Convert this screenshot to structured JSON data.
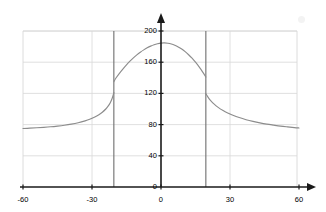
{
  "chart_data": {
    "type": "line",
    "title": "",
    "xlabel": "",
    "ylabel": "",
    "xlim": [
      -60,
      60
    ],
    "ylim": [
      0,
      200
    ],
    "xticks": [
      -60,
      -30,
      0,
      30,
      60
    ],
    "yticks": [
      0,
      40,
      80,
      120,
      160,
      200
    ],
    "xtick_labels": [
      "-60",
      "-30",
      "0",
      "30",
      "60"
    ],
    "ytick_labels": [
      "0",
      "40",
      "80",
      "120",
      "160",
      "200"
    ],
    "grid": true,
    "grid_color": "#d8d8d8",
    "axis_color": "#1a1a1a",
    "curve_color": "#8c8c8c",
    "asymptote_color": "#6e6e6e",
    "background": "#ffffff",
    "legend": null,
    "annotations": [],
    "vertical_lines": [
      -20.5,
      19.5
    ],
    "series": [
      {
        "name": "curve",
        "segments": [
          {
            "name": "left-tail",
            "points": [
              [
                -60,
                75.0
              ],
              [
                -57,
                75.4
              ],
              [
                -54,
                75.9
              ],
              [
                -51,
                76.5
              ],
              [
                -48,
                77.2
              ],
              [
                -45,
                78.1
              ],
              [
                -42,
                79.2
              ],
              [
                -39,
                80.6
              ],
              [
                -36,
                82.4
              ],
              [
                -33,
                84.8
              ],
              [
                -31,
                86.8
              ],
              [
                -29,
                89.4
              ],
              [
                -27,
                92.7
              ],
              [
                -25.5,
                95.9
              ],
              [
                -24,
                100.0
              ],
              [
                -23,
                103.6
              ],
              [
                -22,
                108.4
              ],
              [
                -21.3,
                113.2
              ],
              [
                -20.8,
                117.6
              ],
              [
                -20.5,
                121.0
              ]
            ]
          },
          {
            "name": "central-hump",
            "points": [
              [
                -20.5,
                135.0
              ],
              [
                -19.5,
                140.0
              ],
              [
                -18,
                146.0
              ],
              [
                -16.5,
                151.5
              ],
              [
                -15,
                156.6
              ],
              [
                -13.5,
                161.3
              ],
              [
                -12,
                165.6
              ],
              [
                -10.5,
                169.4
              ],
              [
                -9,
                172.8
              ],
              [
                -7.5,
                175.8
              ],
              [
                -6,
                178.4
              ],
              [
                -4.5,
                180.6
              ],
              [
                -3,
                182.4
              ],
              [
                -1.5,
                183.7
              ],
              [
                0,
                184.5
              ],
              [
                1.5,
                184.7
              ],
              [
                3,
                184.3
              ],
              [
                4.5,
                183.3
              ],
              [
                6,
                181.7
              ],
              [
                7.5,
                179.5
              ],
              [
                9,
                176.8
              ],
              [
                10.5,
                173.5
              ],
              [
                12,
                169.6
              ],
              [
                13.5,
                165.1
              ],
              [
                15,
                160.0
              ],
              [
                16.5,
                154.3
              ],
              [
                18,
                148.0
              ],
              [
                19.5,
                141.0
              ]
            ]
          },
          {
            "name": "right-tail",
            "points": [
              [
                19.5,
                119.5
              ],
              [
                20.5,
                115.0
              ],
              [
                21.5,
                111.2
              ],
              [
                23,
                106.6
              ],
              [
                25,
                101.8
              ],
              [
                27,
                98.0
              ],
              [
                29,
                94.9
              ],
              [
                31,
                92.3
              ],
              [
                34,
                89.0
              ],
              [
                37,
                86.3
              ],
              [
                40,
                84.1
              ],
              [
                43,
                82.2
              ],
              [
                46,
                80.6
              ],
              [
                49,
                79.3
              ],
              [
                52,
                78.1
              ],
              [
                55,
                77.1
              ],
              [
                58,
                76.2
              ],
              [
                60,
                75.7
              ]
            ]
          }
        ]
      }
    ]
  },
  "axes": {
    "x_axis_name": "x-axis",
    "y_axis_name": "y-axis",
    "x_arrow": "right-arrow",
    "y_arrow": "up-arrow"
  }
}
